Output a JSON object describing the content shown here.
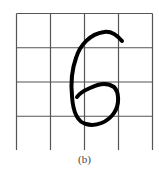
{
  "figure": {
    "grid": {
      "rows": 4,
      "cols": 4,
      "line_color": "#555555"
    },
    "glyph": {
      "character": "6",
      "stroke_color": "#000000"
    },
    "caption": "(b)"
  }
}
